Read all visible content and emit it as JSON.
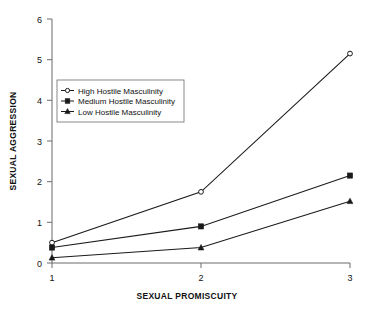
{
  "chart_data": {
    "type": "line",
    "title": "",
    "xlabel": "SEXUAL PROMISCUITY",
    "ylabel": "SEXUAL AGGRESSION",
    "x": [
      1,
      2,
      3
    ],
    "xticklabels": [
      "1",
      "2",
      "3"
    ],
    "yticklabels": [
      "0",
      "1",
      "2",
      "3",
      "4",
      "5",
      "6"
    ],
    "xlim": [
      1,
      3
    ],
    "ylim": [
      0,
      6
    ],
    "grid": false,
    "legend_position": "upper-left-inset",
    "series": [
      {
        "name": "High Hostile Masculinity",
        "marker": "open-circle",
        "values": [
          0.5,
          1.75,
          5.15
        ]
      },
      {
        "name": "Medium Hostile Masculinity",
        "marker": "filled-square",
        "values": [
          0.38,
          0.9,
          2.15
        ]
      },
      {
        "name": "Low Hostile Masculinity",
        "marker": "filled-triangle",
        "values": [
          0.13,
          0.38,
          1.52
        ]
      }
    ],
    "colors": {
      "line": "#1a1a1a",
      "axis": "#6b6b6b",
      "text": "#111111",
      "background": "#ffffff"
    }
  }
}
